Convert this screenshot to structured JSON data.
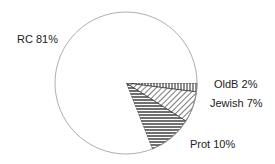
{
  "chart_data": {
    "type": "pie",
    "title": "",
    "start_angle": "3 o'clock, clockwise",
    "categories": [
      "OldB",
      "Jewish",
      "Prot",
      "RC"
    ],
    "values": [
      2,
      7,
      10,
      81
    ],
    "unit": "%",
    "labels": [
      "OldB 2%",
      "Jewish 7%",
      "Prot 10%",
      "RC 81%"
    ],
    "patterns": [
      "vertical-lines",
      "diagonal-lines",
      "horizontal-lines",
      "none"
    ],
    "legend": "none (direct labels)"
  },
  "colors": {
    "stroke": "#888888",
    "hatch": "#222222",
    "background": "#ffffff"
  }
}
